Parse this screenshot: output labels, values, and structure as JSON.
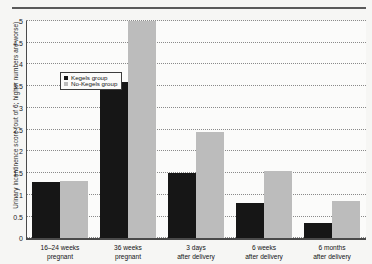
{
  "chart_data": {
    "type": "bar",
    "title": "",
    "xlabel": "",
    "ylabel": "Urinary incontinence score (out of 6; higher numbers are worse)",
    "ylim": [
      0,
      5
    ],
    "ytick_labels": [
      "0",
      "0.5",
      "1",
      "1.5",
      "2",
      "2.5",
      "3",
      "3.5",
      "4",
      "4.5",
      "5"
    ],
    "ytick_values": [
      0,
      0.5,
      1,
      1.5,
      2,
      2.5,
      3,
      3.5,
      4,
      4.5,
      5
    ],
    "grid": true,
    "legend_position": "upper left",
    "categories": [
      "16–24 weeks pregnant",
      "36 weeks pregnant",
      "3 days after delivery",
      "6 weeks after delivery",
      "6 months after delivery"
    ],
    "category_lines": [
      [
        "16–24 weeks",
        "pregnant"
      ],
      [
        "36 weeks",
        "pregnant"
      ],
      [
        "3 days",
        "after delivery"
      ],
      [
        "6 weeks",
        "after delivery"
      ],
      [
        "6 months",
        "after delivery"
      ]
    ],
    "series": [
      {
        "name": "Kegels group",
        "color": "#161616",
        "values": [
          1.3,
          3.6,
          1.5,
          0.82,
          0.35
        ]
      },
      {
        "name": "No-Kegels group",
        "color": "#bcbcbc",
        "values": [
          1.33,
          5.0,
          2.45,
          1.55,
          0.85
        ]
      }
    ]
  },
  "legend": {
    "items": [
      {
        "label": "Kegels group",
        "swatch": "kegels"
      },
      {
        "label": "No-Kegels group",
        "swatch": "nokegels"
      }
    ]
  },
  "colors": {
    "kegels": "#161616",
    "no_kegels": "#bcbcbc",
    "axis": "#4a4a4a",
    "grid": "#8a8a8a",
    "background": "#f6f6f4"
  }
}
